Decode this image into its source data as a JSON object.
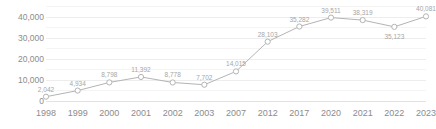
{
  "chart_data": {
    "type": "line",
    "title": "",
    "subtitle": "",
    "xlabel": "",
    "ylabel": "",
    "ylim": [
      0,
      45000
    ],
    "yticks": [
      "0",
      "10,000",
      "20,000",
      "30,000",
      "40,000"
    ],
    "ytick_values": [
      0,
      10000,
      20000,
      30000,
      40000
    ],
    "minor_gridline_values": [
      5000,
      15000,
      25000,
      35000,
      45000
    ],
    "grid": true,
    "legend": "none",
    "categories": [
      "1998",
      "1999",
      "2000",
      "2001",
      "2002",
      "2003",
      "2007",
      "2012",
      "2017",
      "2020",
      "2021",
      "2022",
      "2023"
    ],
    "values": [
      2042,
      4934,
      8798,
      11392,
      8778,
      7702,
      14015,
      28103,
      35282,
      39511,
      38319,
      35123,
      40081
    ],
    "point_labels": [
      "2,042",
      "4,934",
      "8,798",
      "11,392",
      "8,778",
      "7,702",
      "14,015",
      "28,103",
      "35,282",
      "39,511",
      "38,319",
      "35,123",
      "40,081"
    ],
    "label_positions": [
      "above",
      "above",
      "above",
      "above",
      "above",
      "above",
      "above",
      "above",
      "above",
      "above",
      "above",
      "below",
      "above"
    ],
    "marker": "open-circle",
    "line_color": "#b4b4b4",
    "marker_fill": "#ffffff",
    "grid_color": "#ededed",
    "text_color": "#8c8c8c",
    "label_color": "#a6a6a6"
  },
  "watermark": {
    "text": "CUT-OFF"
  }
}
